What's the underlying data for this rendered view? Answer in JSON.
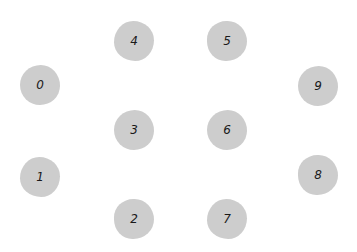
{
  "diagram": {
    "background_color": "#ffffff",
    "node_color": "#cdcdcd",
    "label_color": "#1a1a1a",
    "node_radius": 20,
    "nodes": [
      {
        "id": "0",
        "label": "0",
        "x": 40,
        "y": 85
      },
      {
        "id": "1",
        "label": "1",
        "x": 40,
        "y": 177
      },
      {
        "id": "2",
        "label": "2",
        "x": 134,
        "y": 219
      },
      {
        "id": "3",
        "label": "3",
        "x": 134,
        "y": 130
      },
      {
        "id": "4",
        "label": "4",
        "x": 134,
        "y": 41
      },
      {
        "id": "5",
        "label": "5",
        "x": 227,
        "y": 41
      },
      {
        "id": "6",
        "label": "6",
        "x": 227,
        "y": 130
      },
      {
        "id": "7",
        "label": "7",
        "x": 227,
        "y": 219
      },
      {
        "id": "8",
        "label": "8",
        "x": 318,
        "y": 175
      },
      {
        "id": "9",
        "label": "9",
        "x": 318,
        "y": 86
      }
    ]
  }
}
